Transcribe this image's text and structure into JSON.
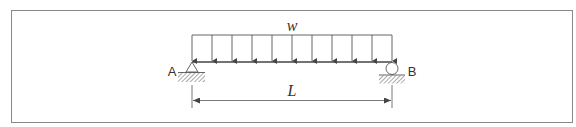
{
  "diagram": {
    "type": "simply-supported beam with uniformly distributed load",
    "load": {
      "label": "w",
      "arrow_count": 11
    },
    "supports": [
      {
        "label": "A",
        "kind": "pin"
      },
      {
        "label": "B",
        "kind": "roller"
      }
    ],
    "dimension": {
      "label": "L"
    }
  },
  "colors": {
    "line": "#555555",
    "frame": "#888888",
    "background": "#ffffff"
  }
}
